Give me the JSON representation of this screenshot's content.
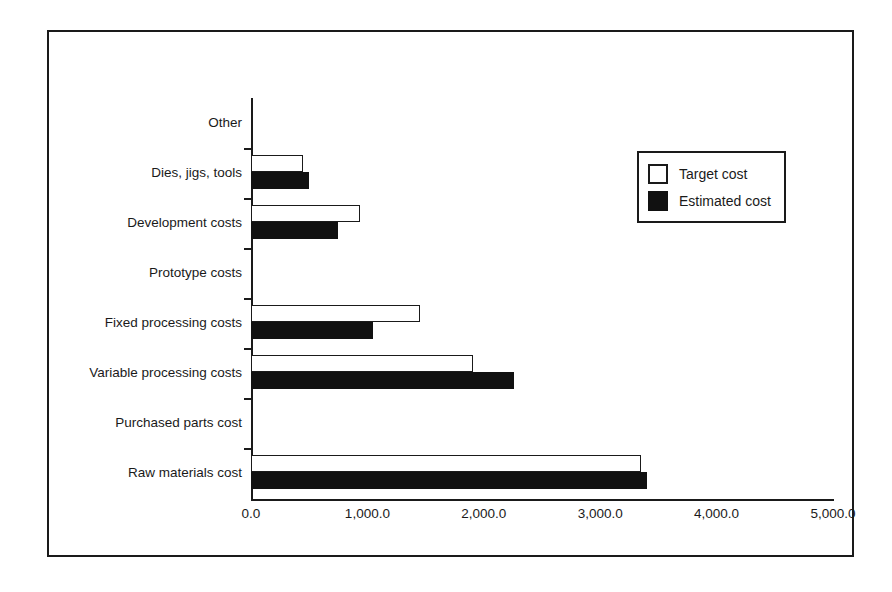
{
  "chart_data": {
    "type": "bar",
    "orientation": "horizontal",
    "title": "",
    "xlabel": "",
    "ylabel": "",
    "xlim": [
      0,
      5000
    ],
    "grid": false,
    "legend_position": "upper right",
    "categories": [
      "Other",
      "Dies, jigs, tools",
      "Development costs",
      "Prototype costs",
      "Fixed processing costs",
      "Variable processing costs",
      "Purchased parts cost",
      "Raw materials cost"
    ],
    "series": [
      {
        "name": "Target cost",
        "values": [
          0,
          450,
          940,
          0,
          1450,
          1910,
          0,
          3350
        ]
      },
      {
        "name": "Estimated cost",
        "values": [
          0,
          500,
          750,
          0,
          1050,
          2260,
          0,
          3400
        ]
      }
    ],
    "xticks": [
      0,
      1000,
      2000,
      3000,
      4000,
      5000
    ],
    "xticklabels": [
      "0.0",
      "1,000.0",
      "2,000.0",
      "3,000.0",
      "4,000.0",
      "5,000.0"
    ]
  },
  "legend": {
    "entries": [
      {
        "label": "Target cost",
        "swatch": "hollow-square-swatch",
        "color": "#ffffff"
      },
      {
        "label": "Estimated cost",
        "swatch": "filled-square-swatch",
        "color": "#111111"
      }
    ]
  },
  "colors": {
    "ink": "#1a1a1a",
    "fill_estimated": "#111111",
    "fill_target": "#ffffff",
    "background": "#ffffff"
  }
}
